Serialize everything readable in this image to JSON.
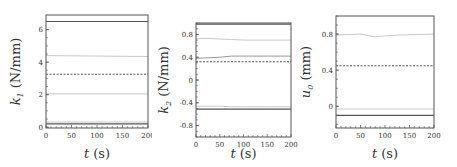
{
  "chart_data": [
    {
      "type": "line",
      "title": "",
      "xlabel": "t (s)",
      "ylabel": "k1 (N/mm)",
      "ylabel_symbol": "k",
      "ylabel_subscript": "1",
      "ylabel_unit": "(N/mm)",
      "xlim": [
        0,
        200
      ],
      "ylim": [
        -0.05,
        6.9
      ],
      "xticks": [
        0,
        50,
        100,
        150,
        200
      ],
      "yticks": [
        0,
        2,
        4,
        6
      ],
      "grid": false,
      "legend": null,
      "x": [
        0,
        200
      ],
      "series": [
        {
          "name": "upper-solid",
          "style": "solid",
          "color": "#555555",
          "values": [
            6.5,
            6.5
          ]
        },
        {
          "name": "upper-light",
          "style": "solid",
          "color": "#c8c8c8",
          "values": [
            4.4,
            4.35
          ]
        },
        {
          "name": "mean-dashed",
          "style": "dashed",
          "color": "#555555",
          "values": [
            3.25,
            3.25
          ]
        },
        {
          "name": "lower-light",
          "style": "solid",
          "color": "#c8c8c8",
          "values": [
            2.05,
            2.05
          ]
        },
        {
          "name": "lower-light-2",
          "style": "solid",
          "color": "#c8c8c8",
          "values": [
            0.32,
            0.32
          ]
        },
        {
          "name": "lower-solid",
          "style": "solid",
          "color": "#555555",
          "values": [
            0.2,
            0.2
          ]
        }
      ]
    },
    {
      "type": "line",
      "title": "",
      "xlabel": "t (s)",
      "ylabel": "k2 (N/mm)",
      "ylabel_symbol": "k",
      "ylabel_subscript": "2",
      "ylabel_unit": "(N/mm)",
      "xlim": [
        0,
        200
      ],
      "ylim": [
        -1.0,
        1.0
      ],
      "xticks": [
        0,
        50,
        100,
        150,
        200
      ],
      "yticks": [
        0.8,
        0.4,
        0,
        -0.4,
        -0.8
      ],
      "ytick_labels": [
        "0.8",
        "0.4",
        "0",
        "-0.4",
        "-0.8"
      ],
      "grid": false,
      "legend": null,
      "x": [
        0,
        25,
        50,
        75,
        100,
        150,
        200
      ],
      "series": [
        {
          "name": "upper-solid",
          "style": "solid",
          "color": "#555555",
          "values": [
            0.98,
            0.98,
            0.98,
            0.98,
            0.98,
            0.98,
            0.98
          ]
        },
        {
          "name": "upper-light",
          "style": "solid",
          "color": "#c8c8c8",
          "values": [
            0.73,
            0.73,
            0.72,
            0.71,
            0.7,
            0.7,
            0.7
          ]
        },
        {
          "name": "mid-gray",
          "style": "solid",
          "color": "#999999",
          "values": [
            0.38,
            0.39,
            0.4,
            0.42,
            0.42,
            0.42,
            0.42
          ]
        },
        {
          "name": "mean-dashed",
          "style": "dashed",
          "color": "#555555",
          "values": [
            0.32,
            0.32,
            0.32,
            0.32,
            0.32,
            0.32,
            0.32
          ]
        },
        {
          "name": "lower-light",
          "style": "solid",
          "color": "#c8c8c8",
          "values": [
            -0.46,
            -0.46,
            -0.46,
            -0.47,
            -0.47,
            -0.47,
            -0.47
          ]
        },
        {
          "name": "lower-solid",
          "style": "solid",
          "color": "#555555",
          "values": [
            -0.51,
            -0.51,
            -0.51,
            -0.51,
            -0.51,
            -0.51,
            -0.51
          ]
        }
      ]
    },
    {
      "type": "line",
      "title": "",
      "xlabel": "t (s)",
      "ylabel": "u0 (mm)",
      "ylabel_symbol": "u",
      "ylabel_subscript": "0",
      "ylabel_unit": "(mm)",
      "xlim": [
        0,
        200
      ],
      "ylim": [
        -0.24,
        1.0
      ],
      "xticks": [
        0,
        50,
        100,
        150,
        200
      ],
      "yticks": [
        0.8,
        0.4,
        0
      ],
      "ytick_labels": [
        "0.8",
        "0.4",
        "0"
      ],
      "grid": false,
      "legend": null,
      "x": [
        0,
        50,
        80,
        100,
        130,
        200
      ],
      "series": [
        {
          "name": "upper-light",
          "style": "solid",
          "color": "#c8c8c8",
          "values": [
            0.79,
            0.8,
            0.77,
            0.78,
            0.79,
            0.8
          ]
        },
        {
          "name": "mean-dashed",
          "style": "dashed",
          "color": "#555555",
          "values": [
            0.45,
            0.45,
            0.45,
            0.45,
            0.45,
            0.45
          ]
        },
        {
          "name": "lower-light",
          "style": "solid",
          "color": "#c8c8c8",
          "values": [
            -0.03,
            -0.03,
            -0.03,
            -0.03,
            -0.03,
            -0.03
          ]
        },
        {
          "name": "lower-solid",
          "style": "solid",
          "color": "#555555",
          "values": [
            -0.1,
            -0.1,
            -0.1,
            -0.1,
            -0.1,
            -0.1
          ]
        }
      ]
    }
  ],
  "panels": [
    {
      "ylabel_symbol": "k",
      "ylabel_subscript": "1",
      "ylabel_unit": "(N/mm)",
      "xlabel_symbol": "t",
      "xlabel_unit": "(s)"
    },
    {
      "ylabel_symbol": "k",
      "ylabel_subscript": "2",
      "ylabel_unit": "(N/mm)",
      "xlabel_symbol": "t",
      "xlabel_unit": "(s)"
    },
    {
      "ylabel_symbol": "u",
      "ylabel_subscript": "0",
      "ylabel_unit": "(mm)",
      "xlabel_symbol": "t",
      "xlabel_unit": "(s)"
    }
  ]
}
